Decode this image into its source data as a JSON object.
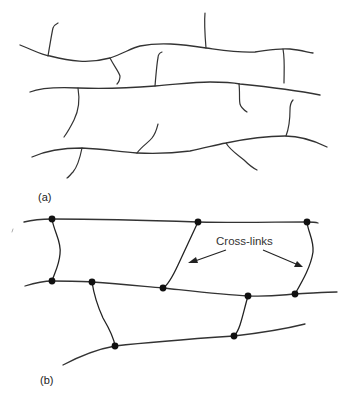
{
  "figure": {
    "panel_a": {
      "label": "(a)",
      "description": "Linear polymer chains with side branches (no cross-links)"
    },
    "panel_b": {
      "label": "(b)",
      "description": "Polymer chains joined by cross-links",
      "annotation": "Cross-links"
    },
    "colors": {
      "line": "#333333",
      "dot": "#111111",
      "background": "#ffffff"
    }
  }
}
